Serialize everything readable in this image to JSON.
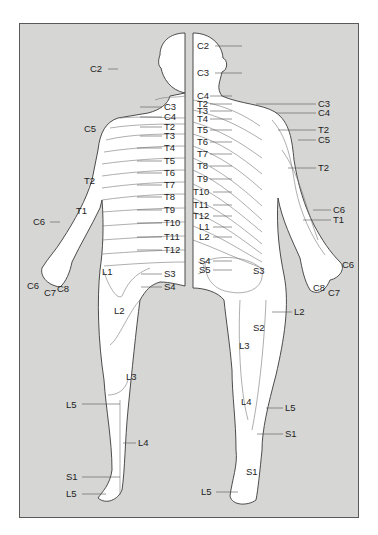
{
  "figure": {
    "frame_color": "#d6d6d4",
    "border_color": "#5a5a5a",
    "views": [
      "anterior",
      "posterior"
    ]
  },
  "anterior": {
    "labels": [
      {
        "text": "C2",
        "x": 90,
        "y": 72,
        "lx": 108,
        "ly": 69,
        "tx": 118
      },
      {
        "text": "C3",
        "x": 164,
        "y": 110,
        "lx": 140,
        "ly": 107,
        "tx": 162
      },
      {
        "text": "C4",
        "x": 164,
        "y": 120,
        "lx": 140,
        "ly": 117,
        "tx": 162
      },
      {
        "text": "C5",
        "x": 84,
        "y": 132
      },
      {
        "text": "T2",
        "x": 164,
        "y": 130,
        "lx": 140,
        "ly": 127,
        "tx": 162
      },
      {
        "text": "T3",
        "x": 164,
        "y": 139,
        "lx": 140,
        "ly": 136,
        "tx": 162
      },
      {
        "text": "T4",
        "x": 164,
        "y": 151,
        "lx": 137,
        "ly": 148,
        "tx": 162
      },
      {
        "text": "T5",
        "x": 164,
        "y": 164,
        "lx": 137,
        "ly": 161,
        "tx": 162
      },
      {
        "text": "T6",
        "x": 164,
        "y": 176,
        "lx": 137,
        "ly": 173,
        "tx": 162
      },
      {
        "text": "T7",
        "x": 164,
        "y": 188,
        "lx": 137,
        "ly": 185,
        "tx": 162
      },
      {
        "text": "T8",
        "x": 164,
        "y": 200,
        "lx": 137,
        "ly": 197,
        "tx": 162
      },
      {
        "text": "T9",
        "x": 164,
        "y": 213,
        "lx": 137,
        "ly": 210,
        "tx": 162
      },
      {
        "text": "T10",
        "x": 164,
        "y": 226,
        "lx": 137,
        "ly": 223,
        "tx": 162
      },
      {
        "text": "T11",
        "x": 164,
        "y": 240,
        "lx": 137,
        "ly": 237,
        "tx": 162
      },
      {
        "text": "T12",
        "x": 164,
        "y": 253,
        "lx": 137,
        "ly": 250,
        "tx": 162
      },
      {
        "text": "T2",
        "x": 84,
        "y": 184
      },
      {
        "text": "T1",
        "x": 76,
        "y": 214
      },
      {
        "text": "C6",
        "x": 33,
        "y": 225,
        "lx": 50,
        "ly": 222,
        "tx": 60
      },
      {
        "text": "C6",
        "x": 27,
        "y": 289
      },
      {
        "text": "C7",
        "x": 44,
        "y": 296
      },
      {
        "text": "C8",
        "x": 57,
        "y": 292
      },
      {
        "text": "L1",
        "x": 102,
        "y": 275
      },
      {
        "text": "S3",
        "x": 164,
        "y": 277,
        "lx": 141,
        "ly": 274,
        "tx": 162
      },
      {
        "text": "S4",
        "x": 164,
        "y": 290,
        "lx": 141,
        "ly": 287,
        "tx": 162
      },
      {
        "text": "L2",
        "x": 114,
        "y": 314
      },
      {
        "text": "L3",
        "x": 126,
        "y": 380
      },
      {
        "text": "L5",
        "x": 66,
        "y": 408,
        "lx": 82,
        "ly": 404,
        "tx": 120
      },
      {
        "text": "L4",
        "x": 138,
        "y": 446,
        "lx": 123,
        "ly": 443,
        "tx": 136
      },
      {
        "text": "S1",
        "x": 66,
        "y": 480,
        "lx": 82,
        "ly": 477,
        "tx": 120
      },
      {
        "text": "L5",
        "x": 66,
        "y": 497,
        "lx": 82,
        "ly": 494,
        "tx": 106
      }
    ]
  },
  "posterior": {
    "labels": [
      {
        "text": "C2",
        "x": 197,
        "y": 49,
        "lx": 215,
        "ly": 46,
        "tx": 242
      },
      {
        "text": "C3",
        "x": 197,
        "y": 76,
        "lx": 215,
        "ly": 73,
        "tx": 242
      },
      {
        "text": "C4",
        "x": 197,
        "y": 99,
        "lx": 210,
        "ly": 96,
        "tx": 232
      },
      {
        "text": "T2",
        "x": 197,
        "y": 107,
        "lx": 210,
        "ly": 104,
        "tx": 232
      },
      {
        "text": "T3",
        "x": 197,
        "y": 114,
        "lx": 210,
        "ly": 111,
        "tx": 232
      },
      {
        "text": "T4",
        "x": 197,
        "y": 122,
        "lx": 210,
        "ly": 119,
        "tx": 232
      },
      {
        "text": "T5",
        "x": 197,
        "y": 133,
        "lx": 210,
        "ly": 130,
        "tx": 232
      },
      {
        "text": "T6",
        "x": 197,
        "y": 145,
        "lx": 210,
        "ly": 142,
        "tx": 232
      },
      {
        "text": "T7",
        "x": 197,
        "y": 157,
        "lx": 210,
        "ly": 154,
        "tx": 232
      },
      {
        "text": "T8",
        "x": 197,
        "y": 169,
        "lx": 210,
        "ly": 166,
        "tx": 232
      },
      {
        "text": "T9",
        "x": 197,
        "y": 182,
        "lx": 210,
        "ly": 179,
        "tx": 232
      },
      {
        "text": "T10",
        "x": 193,
        "y": 195,
        "lx": 213,
        "ly": 192,
        "tx": 232
      },
      {
        "text": "T11",
        "x": 193,
        "y": 208,
        "lx": 213,
        "ly": 205,
        "tx": 232
      },
      {
        "text": "T12",
        "x": 193,
        "y": 219,
        "lx": 213,
        "ly": 216,
        "tx": 232
      },
      {
        "text": "L1",
        "x": 199,
        "y": 230,
        "lx": 213,
        "ly": 227,
        "tx": 232
      },
      {
        "text": "L2",
        "x": 199,
        "y": 240,
        "lx": 213,
        "ly": 237,
        "tx": 232
      },
      {
        "text": "C3",
        "x": 318,
        "y": 107,
        "lx": 256,
        "ly": 104,
        "tx": 316
      },
      {
        "text": "C4",
        "x": 318,
        "y": 116,
        "lx": 276,
        "ly": 113,
        "tx": 316
      },
      {
        "text": "T2",
        "x": 318,
        "y": 133,
        "lx": 278,
        "ly": 130,
        "tx": 316
      },
      {
        "text": "C5",
        "x": 318,
        "y": 143,
        "lx": 298,
        "ly": 140,
        "tx": 316
      },
      {
        "text": "T2",
        "x": 318,
        "y": 171,
        "lx": 288,
        "ly": 168,
        "tx": 316
      },
      {
        "text": "C6",
        "x": 333,
        "y": 213,
        "lx": 313,
        "ly": 210,
        "tx": 331
      },
      {
        "text": "T1",
        "x": 333,
        "y": 223,
        "lx": 303,
        "ly": 220,
        "tx": 331
      },
      {
        "text": "C6",
        "x": 342,
        "y": 268
      },
      {
        "text": "C8",
        "x": 313,
        "y": 291
      },
      {
        "text": "C7",
        "x": 328,
        "y": 296
      },
      {
        "text": "S4",
        "x": 199,
        "y": 264,
        "lx": 213,
        "ly": 261,
        "tx": 232
      },
      {
        "text": "S5",
        "x": 199,
        "y": 273,
        "lx": 213,
        "ly": 270,
        "tx": 232
      },
      {
        "text": "S3",
        "x": 253,
        "y": 274
      },
      {
        "text": "L2",
        "x": 294,
        "y": 315,
        "lx": 272,
        "ly": 312,
        "tx": 292
      },
      {
        "text": "S2",
        "x": 253,
        "y": 331
      },
      {
        "text": "L3",
        "x": 239,
        "y": 349
      },
      {
        "text": "L4",
        "x": 241,
        "y": 405
      },
      {
        "text": "L5",
        "x": 285,
        "y": 411,
        "lx": 266,
        "ly": 408,
        "tx": 283
      },
      {
        "text": "S1",
        "x": 285,
        "y": 437,
        "lx": 257,
        "ly": 434,
        "tx": 283
      },
      {
        "text": "S1",
        "x": 246,
        "y": 475
      },
      {
        "text": "L5",
        "x": 201,
        "y": 495,
        "lx": 216,
        "ly": 492,
        "tx": 238
      }
    ]
  }
}
